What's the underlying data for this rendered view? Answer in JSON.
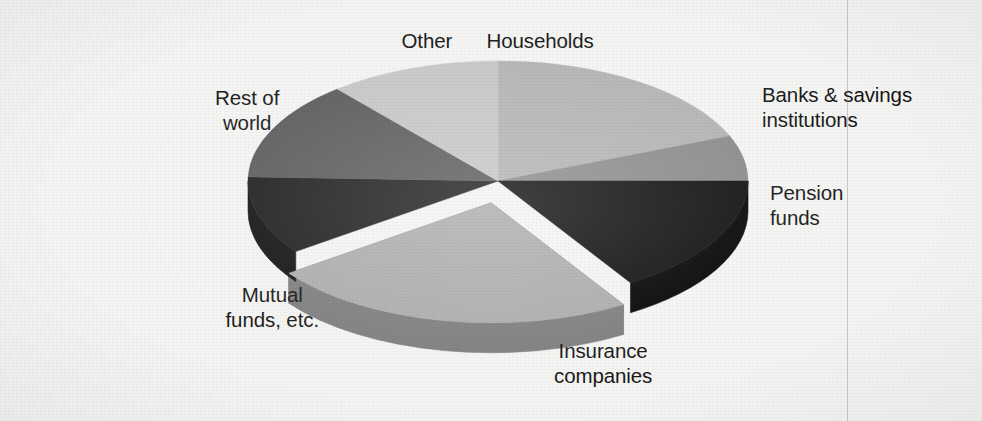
{
  "figure": {
    "background_color": "#f4f4f2",
    "text_color": "#151515",
    "width": 982,
    "height": 421
  },
  "chart_data": {
    "type": "pie",
    "title": "",
    "subtitle": "",
    "xlabel": "",
    "ylabel": "",
    "legend_position": "none",
    "grid": false,
    "style": "3d-exploded-pie-grayscale",
    "note": "Holders of U.S. corporate equities — shares of total, read from slice angles",
    "categories": [
      "Households",
      "Banks & savings institutions",
      "Pension funds",
      "Insurance companies",
      "Mutual funds, etc.",
      "Rest of world",
      "Other"
    ],
    "values": [
      19,
      6,
      16,
      24,
      14,
      12,
      9
    ],
    "units": "percent",
    "slices": [
      {
        "label": "Households",
        "value": 19,
        "start_angle_deg": 0,
        "end_angle_deg": 68,
        "fill": "#b3b3b3",
        "side_fill": "#8f8f8f",
        "exploded": false,
        "label_lines": [
          "Households"
        ],
        "label_align": "center",
        "label_x": 540,
        "label_y": 28
      },
      {
        "label": "Banks & savings institutions",
        "value": 6,
        "start_angle_deg": 68,
        "end_angle_deg": 90,
        "fill": "#8a8a8a",
        "side_fill": "#6a6a6a",
        "exploded": false,
        "label_lines": [
          "Banks & savings",
          "institutions"
        ],
        "label_align": "left",
        "label_x": 762,
        "label_y": 82
      },
      {
        "label": "Pension funds",
        "value": 16,
        "start_angle_deg": 90,
        "end_angle_deg": 148,
        "fill": "#0d0d0d",
        "side_fill": "#000000",
        "exploded": false,
        "label_lines": [
          "Pension",
          "funds"
        ],
        "label_align": "left",
        "label_x": 770,
        "label_y": 180
      },
      {
        "label": "Insurance companies",
        "value": 24,
        "start_angle_deg": 148,
        "end_angle_deg": 234,
        "fill": "#acacac",
        "side_fill": "#7d7d7d",
        "exploded": true,
        "label_lines": [
          "Insurance",
          "companies"
        ],
        "label_align": "center",
        "label_x": 603,
        "label_y": 338
      },
      {
        "label": "Mutual funds, etc.",
        "value": 14,
        "start_angle_deg": 234,
        "end_angle_deg": 272,
        "fill": "#1c1c1c",
        "side_fill": "#101010",
        "exploded": false,
        "label_lines": [
          "Mutual",
          "funds, etc."
        ],
        "label_align": "center",
        "label_x": 272,
        "label_y": 282
      },
      {
        "label": "Rest of world",
        "value": 12,
        "start_angle_deg": 272,
        "end_angle_deg": 320,
        "fill": "#5a5a5a",
        "side_fill": "#404040",
        "exploded": false,
        "label_lines": [
          "Rest of",
          "world"
        ],
        "label_align": "center",
        "label_x": 247,
        "label_y": 85
      },
      {
        "label": "Other",
        "value": 9,
        "start_angle_deg": 320,
        "end_angle_deg": 360,
        "fill": "#c6c6c6",
        "side_fill": "#9a9a9a",
        "exploded": false,
        "label_lines": [
          "Other"
        ],
        "label_align": "center",
        "label_x": 427,
        "label_y": 28
      }
    ],
    "geometry": {
      "center_x": 498,
      "center_y": 181,
      "radius_x": 250,
      "radius_y": 120,
      "depth": 30,
      "explode_offset_x": -10,
      "explode_offset_y": 18
    }
  },
  "artifacts": {
    "scanline_x": 847,
    "scanline_label": "scan-line"
  }
}
